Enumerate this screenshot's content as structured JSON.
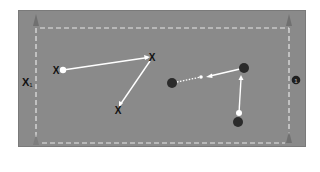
{
  "diagram": {
    "type": "drill-diagram",
    "colors": {
      "field": "#8a8a8a",
      "boundary_dashed": "#e8e8e8",
      "cone": "#6e6e6e",
      "player_x": "#111111",
      "player_circle": "#2b2b2b",
      "ball": "#ffffff",
      "pass_line": "#ffffff"
    },
    "labels": {
      "attacker_label": "X",
      "attacker_label_sub": "1",
      "badge_number": "1"
    },
    "players_x": [
      {
        "id": "x-a",
        "x": 56,
        "y": 70
      },
      {
        "id": "x-b",
        "x": 152,
        "y": 57
      },
      {
        "id": "x-c",
        "x": 118,
        "y": 110
      }
    ],
    "players_o": [
      {
        "id": "o-a",
        "x": 172,
        "y": 83
      },
      {
        "id": "o-b",
        "x": 244,
        "y": 68
      },
      {
        "id": "o-c",
        "x": 238,
        "y": 122
      }
    ],
    "cones": [
      {
        "x": 36,
        "y": 20
      },
      {
        "x": 289,
        "y": 20
      },
      {
        "x": 36,
        "y": 140
      },
      {
        "x": 289,
        "y": 137
      }
    ]
  }
}
